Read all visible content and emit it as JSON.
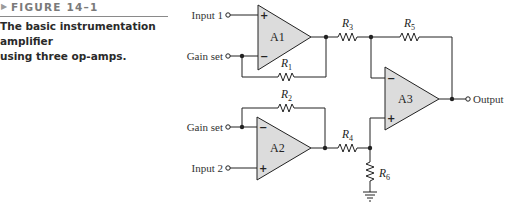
{
  "figure": {
    "marker": "▶",
    "label": "FIGURE 14–1",
    "caption_line1": "The basic instrumentation amplifier",
    "caption_line2": "using three op-amps."
  },
  "circuit": {
    "terminals": {
      "input1": "Input 1",
      "gain_set_top": "Gain set",
      "gain_set_bottom": "Gain set",
      "input2": "Input 2",
      "output": "Output"
    },
    "amplifiers": {
      "a1": "A1",
      "a2": "A2",
      "a3": "A3"
    },
    "resistors": {
      "r1": {
        "letter": "R",
        "sub": "1"
      },
      "r2": {
        "letter": "R",
        "sub": "2"
      },
      "r3": {
        "letter": "R",
        "sub": "3"
      },
      "r4": {
        "letter": "R",
        "sub": "4"
      },
      "r5": {
        "letter": "R",
        "sub": "5"
      },
      "r6": {
        "letter": "R",
        "sub": "6"
      }
    },
    "signs": {
      "plus": "+",
      "minus": "−"
    },
    "colors": {
      "opamp_fill": "#dcdcdc",
      "wire": "#222222"
    }
  }
}
